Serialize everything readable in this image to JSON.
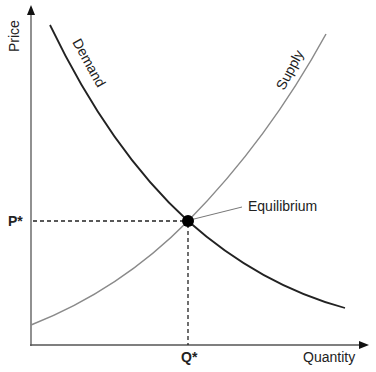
{
  "diagram": {
    "type": "supply-demand",
    "axes": {
      "y_label": "Price",
      "x_label": "Quantity"
    },
    "curves": {
      "demand_label": "Demand",
      "supply_label": "Supply"
    },
    "equilibrium": {
      "label": "Equilibrium",
      "price_label": "P*",
      "quantity_label": "Q*"
    },
    "colors": {
      "axis": "#555555",
      "demand": "#222222",
      "supply": "#888888",
      "guide": "#222222",
      "point": "#000000"
    }
  }
}
